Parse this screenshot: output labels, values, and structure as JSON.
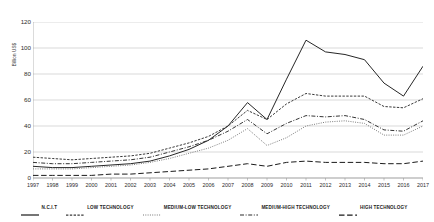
{
  "chart_data": {
    "type": "line",
    "title": "",
    "xlabel": "",
    "ylabel": "Billion US$",
    "ylim": [
      0,
      120
    ],
    "yticks": [
      0,
      20,
      40,
      60,
      80,
      100,
      120
    ],
    "grid": true,
    "legend_position": "bottom",
    "x": [
      "1997",
      "1998",
      "1999",
      "2000",
      "2001",
      "2002",
      "2003",
      "2004",
      "2005",
      "2006",
      "2007",
      "2008",
      "2009",
      "2010",
      "2011",
      "2012",
      "2013",
      "2014",
      "2015",
      "2016",
      "2017"
    ],
    "series": [
      {
        "name": "N.C.I.T",
        "style": "solid",
        "color": "#1a1a1a",
        "values": [
          9,
          8,
          8,
          9,
          10,
          11,
          13,
          17,
          22,
          29,
          40,
          58,
          45,
          76,
          106,
          97,
          95,
          91,
          73,
          63,
          86
        ]
      },
      {
        "name": "LOW TECHNOLOGY",
        "style": "dotted-dense",
        "color": "#3a3a3a",
        "values": [
          16,
          15,
          14,
          15,
          16,
          17,
          19,
          23,
          27,
          32,
          40,
          52,
          45,
          57,
          65,
          63,
          63,
          63,
          55,
          54,
          61
        ]
      },
      {
        "name": "MEDIUM-LOW TECHNOLOGY",
        "style": "dotted-fine",
        "color": "#777777",
        "values": [
          7,
          7,
          7,
          8,
          9,
          10,
          12,
          15,
          19,
          23,
          29,
          38,
          25,
          31,
          40,
          43,
          44,
          42,
          33,
          33,
          40
        ]
      },
      {
        "name": "MEDIUM-HIGH TECHNOLOGY",
        "style": "dash-dot",
        "color": "#2b2b2b",
        "values": [
          12,
          11,
          11,
          12,
          13,
          14,
          16,
          20,
          24,
          29,
          36,
          45,
          34,
          42,
          48,
          47,
          48,
          45,
          37,
          36,
          44
        ]
      },
      {
        "name": "HIGH TECHNOLOGY",
        "style": "dashed-long",
        "color": "#1a1a1a",
        "values": [
          2,
          2,
          2,
          2,
          3,
          3,
          4,
          5,
          6,
          7,
          9,
          11,
          9,
          12,
          13,
          12,
          12,
          12,
          11,
          11,
          13
        ]
      }
    ]
  }
}
